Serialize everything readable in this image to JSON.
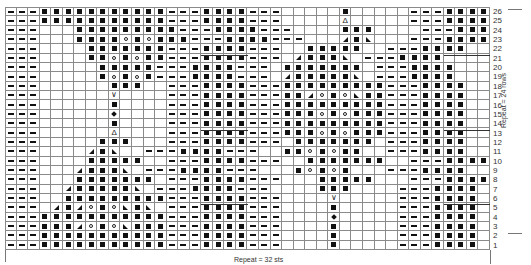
{
  "chart_data": {
    "type": "table",
    "xlabel": "Repeat = 32 sts",
    "ylabel": "Repeat = 24 rows",
    "row_numbers": [
      26,
      25,
      24,
      23,
      22,
      21,
      20,
      19,
      18,
      17,
      16,
      15,
      14,
      13,
      12,
      11,
      10,
      9,
      8,
      7,
      6,
      5,
      4,
      3,
      2,
      1
    ],
    "columns": 42,
    "legend_symbols": {
      "-": "purl",
      "#": "knit tbl (filled square)",
      "o": "yarn over",
      "/": "right-leaning decrease",
      "\\": "left-leaning decrease",
      "A": "centered double decrease",
      "V": "increase",
      "+": "bobble",
      ".": "knit (blank)"
    },
    "rows": [
      "---###########---####---.....#.....---####",
      "---###########---####---.....A.....---####",
      "---...#########---####---....###....---####",
      "---...####o#o###---####---.../#\\...---####",
      "---....#######---####---..#####..---####",
      "---....##o#o##---####---./###\\.---####",
      "---.....#####---####---.#######.---####",
      "---.....#o#o#---####---./#####\\.---####",
      "---......###..---####---#########---####",
      "---......V....---####---##/o#o\\##---####",
      "---......#....---####---#########---####",
      "---......+....---####---###o#o###---####",
      "---......#....---####---#########---####",
      "---......A....---####---###o#o###---####",
      "---.....###...---####---.#######.---####",
      "---..../#\\..---####---..##o#o##..---####",
      "---....#####..---####---..#######..---####",
      "---.../###\\.---####---...#o#o#...---####",
      "---...#######.---####---...#####...---####",
      "---../#####\\.---####---....###....---####",
      "---..#########---####---....V.....---####",
      "---./#/o#o\\#\\.---####---....#.....---####",
      "---###########---####---....+.....---####",
      "---###/o#o\\###---####---....#.....---####",
      "---###########---####---....#.....---####",
      "---###########---####---....#.....---####"
    ]
  }
}
